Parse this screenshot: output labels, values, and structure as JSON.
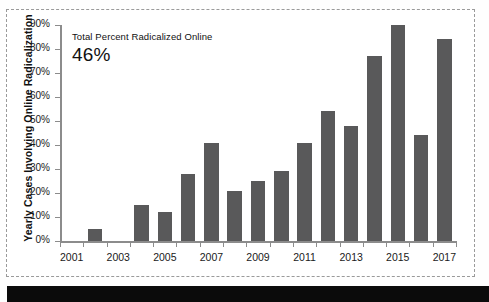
{
  "frame": {
    "style": "dashed-scan-border"
  },
  "annotation": {
    "label": "Total Percent Radicalized Online",
    "value": "46%"
  },
  "colors": {
    "bar_fill": "#59595a",
    "axis": "#8c8c8c",
    "text": "#111111",
    "frame_border": "#9a9a9a",
    "bottom_strip": "#0b0b0b"
  },
  "chart_data": {
    "type": "bar",
    "title": "",
    "xlabel": "",
    "ylabel": "Yearly Cases Involving Online Radicalization",
    "ylim": [
      0,
      90
    ],
    "grid": false,
    "legend": false,
    "ytick_labels": [
      "0%",
      "10%",
      "20%",
      "30%",
      "40%",
      "50%",
      "60%",
      "70%",
      "80%",
      "90%"
    ],
    "ytick_values": [
      0,
      10,
      20,
      30,
      40,
      50,
      60,
      70,
      80,
      90
    ],
    "xtick_labels": [
      "2001",
      "2003",
      "2005",
      "2007",
      "2009",
      "2011",
      "2013",
      "2015",
      "2017"
    ],
    "categories": [
      "2001",
      "2002",
      "2003",
      "2004",
      "2005",
      "2006",
      "2007",
      "2008",
      "2009",
      "2010",
      "2011",
      "2012",
      "2013",
      "2014",
      "2015",
      "2016",
      "2017"
    ],
    "values": [
      0,
      5,
      0,
      15,
      12,
      28,
      41,
      21,
      25,
      29,
      41,
      54,
      48,
      77,
      90,
      44,
      84
    ],
    "annotations": [
      {
        "text": "Total Percent Radicalized Online",
        "value": "46%"
      }
    ]
  }
}
